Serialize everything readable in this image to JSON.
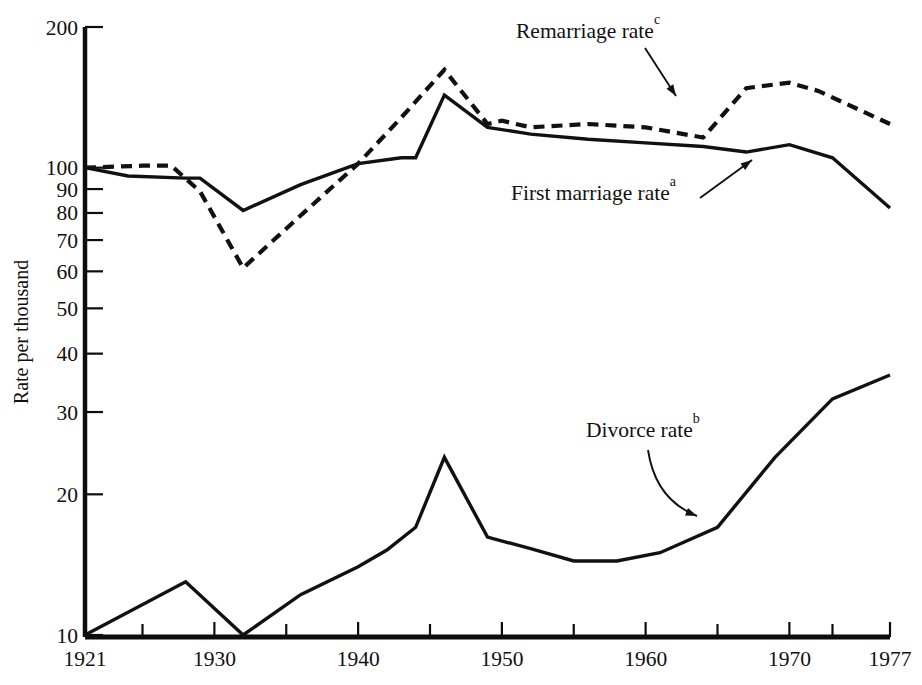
{
  "chart_data": {
    "type": "line",
    "title": "",
    "subtitle": "",
    "xlabel": "",
    "ylabel": "Rate per thousand",
    "x_axis": {
      "type": "linear",
      "min": 1921,
      "max": 1977,
      "tick_labels": [
        "1921",
        "1930",
        "1940",
        "1950",
        "1960",
        "1970",
        "1977"
      ],
      "tick_values": [
        1921,
        1930,
        1940,
        1950,
        1960,
        1970,
        1977
      ],
      "minor_tick_values": [
        1925,
        1935,
        1945,
        1955,
        1965,
        1973
      ]
    },
    "y_axis": {
      "type": "log",
      "min": 10,
      "max": 200,
      "tick_labels": [
        "200",
        "100",
        "90",
        "80",
        "70",
        "60",
        "50",
        "40",
        "30",
        "20",
        "10"
      ],
      "tick_values": [
        200,
        100,
        90,
        80,
        70,
        60,
        50,
        40,
        30,
        20,
        10
      ]
    },
    "grid": false,
    "legend": "inline-annotations",
    "series": [
      {
        "name": "First marriage rate",
        "footnote": "a",
        "style": "solid",
        "label_text": "First marriage rate",
        "points": [
          [
            1921,
            100
          ],
          [
            1924,
            96
          ],
          [
            1928,
            95
          ],
          [
            1929,
            95
          ],
          [
            1932,
            81
          ],
          [
            1936,
            92
          ],
          [
            1940,
            102
          ],
          [
            1943,
            105
          ],
          [
            1944,
            105
          ],
          [
            1946,
            143
          ],
          [
            1949,
            122
          ],
          [
            1952,
            118
          ],
          [
            1956,
            115
          ],
          [
            1960,
            113
          ],
          [
            1964,
            111
          ],
          [
            1967,
            108
          ],
          [
            1970,
            112
          ],
          [
            1973,
            105
          ],
          [
            1977,
            82
          ]
        ]
      },
      {
        "name": "Divorce rate",
        "footnote": "b",
        "style": "solid",
        "label_text": "Divorce rate",
        "points": [
          [
            1921,
            10.0
          ],
          [
            1928,
            13.0
          ],
          [
            1932,
            10.0
          ],
          [
            1936,
            12.2
          ],
          [
            1940,
            14.0
          ],
          [
            1942,
            15.2
          ],
          [
            1944,
            17.0
          ],
          [
            1946,
            24.0
          ],
          [
            1949,
            16.2
          ],
          [
            1952,
            15.3
          ],
          [
            1955,
            14.4
          ],
          [
            1958,
            14.4
          ],
          [
            1961,
            15.0
          ],
          [
            1965,
            17.0
          ],
          [
            1969,
            24.0
          ],
          [
            1973,
            32.0
          ],
          [
            1977,
            36.0
          ]
        ]
      },
      {
        "name": "Remarriage rate",
        "footnote": "c",
        "style": "dashed",
        "label_text": "Remarriage rate",
        "points": [
          [
            1921,
            100
          ],
          [
            1925,
            101
          ],
          [
            1927,
            101
          ],
          [
            1929,
            89
          ],
          [
            1932,
            61
          ],
          [
            1936,
            79
          ],
          [
            1940,
            102
          ],
          [
            1943,
            128
          ],
          [
            1946,
            162
          ],
          [
            1949,
            124
          ],
          [
            1950,
            126
          ],
          [
            1952,
            122
          ],
          [
            1956,
            124
          ],
          [
            1960,
            122
          ],
          [
            1964,
            116
          ],
          [
            1967,
            148
          ],
          [
            1970,
            152
          ],
          [
            1972,
            146
          ],
          [
            1977,
            124
          ]
        ]
      }
    ],
    "annotations": [
      {
        "id": "remarriage-annotation",
        "text": "Remarriage rate",
        "superscript": "c",
        "label_x": 516,
        "label_y": 38,
        "arrow_from": [
          645,
          48
        ],
        "arrow_to": [
          676,
          96
        ]
      },
      {
        "id": "first-marriage-annotation",
        "text": "First marriage rate",
        "superscript": "a",
        "label_x": 511,
        "label_y": 200,
        "arrow_from": [
          700,
          198
        ],
        "arrow_to": [
          752,
          160
        ]
      },
      {
        "id": "divorce-annotation",
        "text": "Divorce rate",
        "superscript": "b",
        "label_x": 586,
        "label_y": 437,
        "arrow_from": [
          648,
          450
        ],
        "arrow_to": [
          697,
          516
        ]
      }
    ]
  }
}
